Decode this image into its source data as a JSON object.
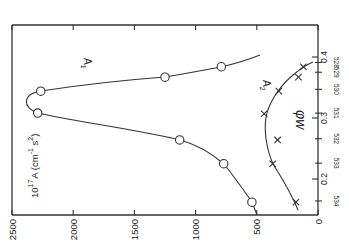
{
  "chart_data": {
    "type": "line",
    "orientation": "rotated-90",
    "title": "",
    "xlabel": "φw",
    "ylabel": "10^17 A (cm^-1 s^2)",
    "value_axis": {
      "label_prefix": "10",
      "label_exp": "17",
      "label_main": "A (cm",
      "label_exp2": "-1",
      "label_s": " s",
      "label_exp3": "2",
      "label_close": ")",
      "ticks": [
        2500,
        2000,
        1500,
        1000,
        500,
        0
      ],
      "tick_labels": [
        "2500",
        "2000",
        "1500",
        "1000",
        "500",
        "0"
      ],
      "range": [
        0,
        2500
      ]
    },
    "phi_axis": {
      "label": "φw",
      "ticks": [
        0.2,
        0.3,
        0.4
      ],
      "tick_labels": [
        "0.2",
        "0.3",
        "0.4"
      ],
      "range": [
        0.15,
        0.46
      ]
    },
    "secondary_axis": {
      "tick_labels": [
        "528",
        "529",
        "530",
        "531",
        "532",
        "533",
        "534"
      ],
      "tick_phi": [
        0.391,
        0.375,
        0.347,
        0.308,
        0.266,
        0.226,
        0.164
      ]
    },
    "series": [
      {
        "name": "A1",
        "label_main": "A",
        "label_sub": "1",
        "marker": "circle",
        "points": [
          {
            "phi": 0.162,
            "A": 540
          },
          {
            "phi": 0.225,
            "A": 770
          },
          {
            "phi": 0.264,
            "A": 1130
          },
          {
            "phi": 0.308,
            "A": 2290
          },
          {
            "phi": 0.344,
            "A": 2265
          },
          {
            "phi": 0.367,
            "A": 1250
          },
          {
            "phi": 0.384,
            "A": 790
          }
        ]
      },
      {
        "name": "A2",
        "label_main": "A",
        "label_sub": "2",
        "marker": "cross",
        "points": [
          {
            "phi": 0.162,
            "A": 180
          },
          {
            "phi": 0.225,
            "A": 370
          },
          {
            "phi": 0.264,
            "A": 330
          },
          {
            "phi": 0.307,
            "A": 440
          },
          {
            "phi": 0.344,
            "A": 320
          },
          {
            "phi": 0.367,
            "A": 160
          },
          {
            "phi": 0.384,
            "A": 120
          }
        ]
      }
    ],
    "grid": false,
    "legend": "inline curve labels"
  }
}
